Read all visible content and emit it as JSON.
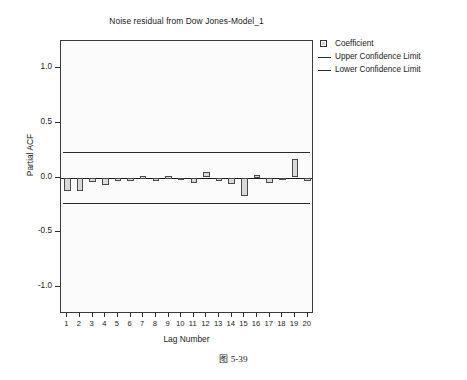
{
  "chart_data": {
    "type": "bar",
    "title": "Noise residual from Dow Jones-Model_1",
    "xlabel": "Lag Number",
    "ylabel": "Partial ACF",
    "ylim": [
      -1.25,
      1.25
    ],
    "ytick_labels": [
      "1.0",
      "0.5",
      "0.0",
      "-0.5",
      "-1.0"
    ],
    "ytick_values": [
      1.0,
      0.5,
      0.0,
      -0.5,
      -1.0
    ],
    "grid": false,
    "legend_position": "top-right",
    "categories": [
      1,
      2,
      3,
      4,
      5,
      6,
      7,
      8,
      9,
      10,
      11,
      12,
      13,
      14,
      15,
      16,
      17,
      18,
      19,
      20
    ],
    "xtick_labels": [
      "1",
      "2",
      "3",
      "4",
      "5",
      "6",
      "7",
      "8",
      "9",
      "10",
      "11",
      "12",
      "13",
      "14",
      "15",
      "16",
      "17",
      "18",
      "19",
      "20"
    ],
    "series": [
      {
        "name": "Coefficient",
        "values": [
          -0.12,
          -0.12,
          -0.04,
          -0.07,
          -0.03,
          -0.03,
          0.01,
          -0.03,
          0.01,
          -0.02,
          -0.05,
          0.05,
          -0.03,
          -0.06,
          -0.17,
          0.02,
          -0.05,
          -0.01,
          0.17,
          -0.03
        ]
      }
    ],
    "reference_lines": [
      {
        "name": "Upper Confidence Limit",
        "value": 0.23
      },
      {
        "name": "Lower Confidence Limit",
        "value": -0.23
      }
    ],
    "colors": {
      "bar_fill": "#d9d9d9",
      "bar_edge": "#4a4a4a",
      "line": "#2a2a2a",
      "plot_background": "#fbfbfb",
      "frame": "#3a3a3a"
    }
  },
  "legend": {
    "items": [
      {
        "label": "Coefficient",
        "marker": "square-swatch"
      },
      {
        "label": "Upper Confidence Limit",
        "marker": "line"
      },
      {
        "label": "Lower Confidence Limit",
        "marker": "line"
      }
    ]
  },
  "caption": {
    "glyph": "图",
    "number": "5-39"
  }
}
